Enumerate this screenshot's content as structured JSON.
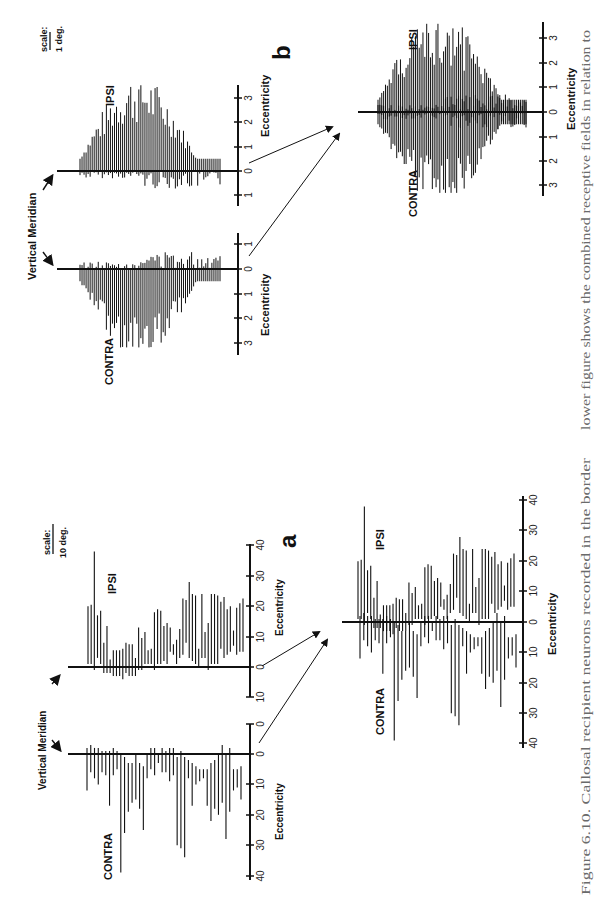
{
  "caption": {
    "line1": "Figure 6.10. Callosal recipient neurons recorded in the border",
    "line2": "lower figure shows the combined receptive fields in relation to"
  },
  "panels": {
    "a": {
      "letter": "a",
      "scale_label": "scale:",
      "scale_value": "10 deg.",
      "vertical_meridian": "Vertical Meridian",
      "ipsi": "IPSI",
      "contra": "CONTRA",
      "xlabel": "Eccentricity",
      "ipsi_ticks": [
        "10",
        "0",
        "10",
        "20",
        "30",
        "40"
      ],
      "contra_ticks": [
        "0",
        "0",
        "10",
        "20",
        "30",
        "40"
      ],
      "combined_ticks": [
        "40",
        "30",
        "20",
        "10",
        "0",
        "10",
        "20",
        "30",
        "40"
      ]
    },
    "b": {
      "letter": "b",
      "scale_label": "scale:",
      "scale_value": "1 deg.",
      "vertical_meridian": "Vertical Meridian",
      "ipsi": "IPSI",
      "contra": "CONTRA",
      "xlabel": "Eccentricity",
      "ipsi_ticks": [
        "1",
        "0",
        "1",
        "2",
        "3"
      ],
      "contra_ticks": [
        "1",
        "0",
        "1",
        "2",
        "3"
      ],
      "combined_ticks": [
        "3",
        "2",
        "1",
        "0",
        "1",
        "2",
        "3"
      ]
    }
  },
  "chart_data": [
    {
      "type": "bar",
      "title": "a — IPSI receptive fields (range bars, deg)",
      "xlabel": "Eccentricity",
      "ylim": [
        -10,
        40
      ],
      "ranges": [
        [
          1,
          20
        ],
        [
          1,
          20.5
        ],
        [
          -1,
          38
        ],
        [
          3,
          17
        ],
        [
          1,
          18.5
        ],
        [
          -2,
          8
        ],
        [
          -2,
          13.5
        ],
        [
          -2,
          2.5
        ],
        [
          -3,
          5.5
        ],
        [
          -3,
          5.5
        ],
        [
          -3,
          5.5
        ],
        [
          -4,
          6
        ],
        [
          -2,
          8
        ],
        [
          -3,
          7.5
        ],
        [
          -3,
          7.5
        ],
        [
          -3,
          3
        ],
        [
          -1,
          13
        ],
        [
          -1,
          9.5
        ],
        [
          1,
          11.5
        ],
        [
          1,
          5.5
        ],
        [
          1,
          6
        ],
        [
          -1,
          18
        ],
        [
          1,
          19
        ],
        [
          1,
          18.5
        ],
        [
          2,
          13.5
        ],
        [
          1,
          14.5
        ],
        [
          5,
          13
        ],
        [
          4,
          7.5
        ],
        [
          1,
          9
        ],
        [
          3,
          12.5
        ],
        [
          4,
          22.5
        ],
        [
          8,
          22
        ],
        [
          3,
          28
        ],
        [
          2,
          24
        ],
        [
          1,
          23.5
        ],
        [
          0,
          6
        ],
        [
          3,
          24
        ],
        [
          3,
          11.5
        ],
        [
          -1,
          14.5
        ],
        [
          1,
          24
        ],
        [
          1,
          24
        ],
        [
          1,
          23.5
        ],
        [
          6,
          21.5
        ],
        [
          3,
          23
        ],
        [
          4,
          19
        ],
        [
          5,
          20
        ],
        [
          7,
          12
        ],
        [
          4,
          19.5
        ],
        [
          5,
          21
        ],
        [
          5,
          22.5
        ]
      ]
    },
    {
      "type": "bar",
      "title": "a — CONTRA receptive fields (range bars, deg)",
      "xlabel": "Eccentricity",
      "ylim": [
        -5,
        40
      ],
      "ranges": [
        [
          -2,
          12
        ],
        [
          -3,
          6
        ],
        [
          -2,
          8
        ],
        [
          -2,
          10
        ],
        [
          -1,
          6
        ],
        [
          -1,
          7
        ],
        [
          -1,
          17
        ],
        [
          -2,
          7
        ],
        [
          -1,
          5
        ],
        [
          0,
          39
        ],
        [
          1,
          26
        ],
        [
          3,
          19
        ],
        [
          3,
          16
        ],
        [
          0,
          15
        ],
        [
          3,
          18
        ],
        [
          4,
          25
        ],
        [
          0,
          8
        ],
        [
          -2,
          5
        ],
        [
          -2,
          7
        ],
        [
          0,
          3
        ],
        [
          -2,
          6
        ],
        [
          -1,
          6
        ],
        [
          -2,
          9
        ],
        [
          -2,
          7
        ],
        [
          1,
          30
        ],
        [
          -1,
          31
        ],
        [
          1,
          34
        ],
        [
          2,
          8
        ],
        [
          3,
          17
        ],
        [
          4,
          10
        ],
        [
          5,
          9
        ],
        [
          5,
          8
        ],
        [
          5,
          17
        ],
        [
          3,
          22
        ],
        [
          2,
          18
        ],
        [
          0,
          20
        ],
        [
          -3,
          16
        ],
        [
          0,
          28
        ],
        [
          -2,
          19
        ],
        [
          5,
          12
        ],
        [
          5,
          11
        ],
        [
          4,
          15
        ]
      ]
    },
    {
      "type": "bar",
      "title": "a — Combined receptive fields relative to vertical meridian",
      "xlabel": "Eccentricity",
      "ylim": [
        -40,
        40
      ],
      "note": "IPSI positive, CONTRA negative; combined plot superimposes both sets"
    },
    {
      "type": "bar",
      "title": "b — IPSI receptive fields (range bars, deg)",
      "xlabel": "Eccentricity",
      "ylim": [
        -1,
        3.5
      ],
      "note": "dense small receptive fields concentrated within ±1.5 deg of vertical meridian"
    },
    {
      "type": "bar",
      "title": "b — CONTRA receptive fields (range bars, deg)",
      "xlabel": "Eccentricity",
      "ylim": [
        -1,
        3.2
      ]
    },
    {
      "type": "bar",
      "title": "b — Combined receptive fields relative to vertical meridian",
      "xlabel": "Eccentricity",
      "ylim": [
        -3.5,
        3.5
      ]
    }
  ]
}
